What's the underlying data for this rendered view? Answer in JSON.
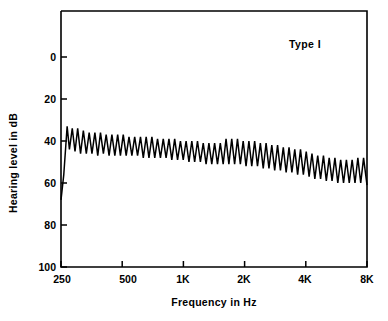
{
  "chart_data": {
    "type": "line",
    "title": "",
    "annotation": "Type I",
    "xlabel": "Frequency in Hz",
    "ylabel": "Hearing level in dB",
    "xscale": "log",
    "xlim": [
      250,
      8000
    ],
    "ylim": [
      0,
      100
    ],
    "y_inverted": true,
    "grid": false,
    "legend": "none",
    "xticks": [
      {
        "value": 250,
        "label": "250"
      },
      {
        "value": 500,
        "label": "500"
      },
      {
        "value": 1000,
        "label": "1K"
      },
      {
        "value": 2000,
        "label": "2K"
      },
      {
        "value": 4000,
        "label": "4K"
      },
      {
        "value": 8000,
        "label": "8K"
      }
    ],
    "yticks": [
      {
        "value": 0,
        "label": "0"
      },
      {
        "value": 20,
        "label": "20"
      },
      {
        "value": 40,
        "label": "40"
      },
      {
        "value": 60,
        "label": "60"
      },
      {
        "value": 80,
        "label": "80"
      },
      {
        "value": 100,
        "label": "100"
      }
    ],
    "series": [
      {
        "name": "Bekesy continuous tone tracing",
        "description": "Sawtooth Bekesy audiogram tracing, Type I pattern",
        "points": [
          [
            250,
            68
          ],
          [
            258,
            56
          ],
          [
            268,
            33
          ],
          [
            275,
            44
          ],
          [
            284,
            34
          ],
          [
            293,
            45
          ],
          [
            302,
            34
          ],
          [
            312,
            46
          ],
          [
            322,
            35
          ],
          [
            333,
            46
          ],
          [
            344,
            36
          ],
          [
            355,
            46
          ],
          [
            367,
            36
          ],
          [
            379,
            47
          ],
          [
            391,
            36
          ],
          [
            404,
            46
          ],
          [
            417,
            37
          ],
          [
            431,
            47
          ],
          [
            445,
            37
          ],
          [
            460,
            47
          ],
          [
            475,
            37
          ],
          [
            490,
            47
          ],
          [
            506,
            37
          ],
          [
            523,
            47
          ],
          [
            540,
            38
          ],
          [
            558,
            47
          ],
          [
            576,
            38
          ],
          [
            595,
            47
          ],
          [
            615,
            38
          ],
          [
            635,
            48
          ],
          [
            656,
            38
          ],
          [
            677,
            48
          ],
          [
            700,
            38
          ],
          [
            723,
            48
          ],
          [
            746,
            39
          ],
          [
            771,
            48
          ],
          [
            796,
            39
          ],
          [
            822,
            48
          ],
          [
            849,
            39
          ],
          [
            877,
            49
          ],
          [
            906,
            39
          ],
          [
            936,
            49
          ],
          [
            967,
            40
          ],
          [
            998,
            49
          ],
          [
            1031,
            40
          ],
          [
            1065,
            50
          ],
          [
            1100,
            40
          ],
          [
            1136,
            50
          ],
          [
            1173,
            40
          ],
          [
            1212,
            50
          ],
          [
            1252,
            41
          ],
          [
            1293,
            51
          ],
          [
            1335,
            41
          ],
          [
            1379,
            51
          ],
          [
            1424,
            41
          ],
          [
            1471,
            51
          ],
          [
            1519,
            41
          ],
          [
            1569,
            51
          ],
          [
            1621,
            39
          ],
          [
            1674,
            51
          ],
          [
            1729,
            39
          ],
          [
            1786,
            51
          ],
          [
            1845,
            39
          ],
          [
            1906,
            51
          ],
          [
            1968,
            40
          ],
          [
            2033,
            52
          ],
          [
            2100,
            40
          ],
          [
            2169,
            52
          ],
          [
            2241,
            40
          ],
          [
            2314,
            52
          ],
          [
            2391,
            41
          ],
          [
            2470,
            53
          ],
          [
            2551,
            41
          ],
          [
            2635,
            53
          ],
          [
            2722,
            42
          ],
          [
            2812,
            54
          ],
          [
            2905,
            42
          ],
          [
            3001,
            54
          ],
          [
            3100,
            43
          ],
          [
            3202,
            55
          ],
          [
            3308,
            43
          ],
          [
            3417,
            55
          ],
          [
            3530,
            44
          ],
          [
            3646,
            56
          ],
          [
            3767,
            44
          ],
          [
            3891,
            56
          ],
          [
            4020,
            45
          ],
          [
            4153,
            57
          ],
          [
            4290,
            46
          ],
          [
            4431,
            58
          ],
          [
            4578,
            47
          ],
          [
            4729,
            58
          ],
          [
            4885,
            47
          ],
          [
            5046,
            59
          ],
          [
            5213,
            48
          ],
          [
            5385,
            59
          ],
          [
            5563,
            48
          ],
          [
            5747,
            60
          ],
          [
            5937,
            49
          ],
          [
            6133,
            60
          ],
          [
            6335,
            49
          ],
          [
            6544,
            60
          ],
          [
            6760,
            49
          ],
          [
            6983,
            60
          ],
          [
            7213,
            48
          ],
          [
            7451,
            60
          ],
          [
            7696,
            48
          ],
          [
            8000,
            61
          ]
        ]
      }
    ]
  },
  "axes": {
    "frame_color": "#000000",
    "line_color": "#000000"
  }
}
